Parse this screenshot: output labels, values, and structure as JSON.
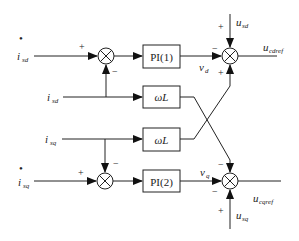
{
  "diagram": {
    "type": "control-block-diagram",
    "inputs": {
      "isd_ref": {
        "base": "i",
        "sub": "sd",
        "mark": "•"
      },
      "isd": {
        "base": "i",
        "sub": "sd"
      },
      "isq": {
        "base": "i",
        "sub": "sq"
      },
      "isq_ref": {
        "base": "i",
        "sub": "sq",
        "mark": "•"
      },
      "usd": {
        "base": "u",
        "sub": "sd"
      },
      "usq": {
        "base": "u",
        "sub": "sq"
      }
    },
    "outputs": {
      "ucdref": {
        "base": "u",
        "sub": "cdref"
      },
      "ucqref": {
        "base": "u",
        "sub": "cqref"
      }
    },
    "blocks": {
      "pi1": "PI(1)",
      "wl_top": "ωL",
      "wl_bottom": "ωL",
      "pi2": "PI(2)"
    },
    "signals": {
      "vd": {
        "base": "v",
        "sub": "d"
      },
      "vq": {
        "base": "v",
        "sub": "q"
      }
    },
    "signs": {
      "sum1_plus": "+",
      "sum1_minus": "−",
      "sum2_plus": "+",
      "sum2_minus": "−",
      "sum3_top_plus": "+",
      "sum3_left_minus": "−",
      "sum3_bottom_plus": "+",
      "sum4_top_minus": "−",
      "sum4_left_minus": "−",
      "sum4_bottom_plus": "+"
    }
  }
}
